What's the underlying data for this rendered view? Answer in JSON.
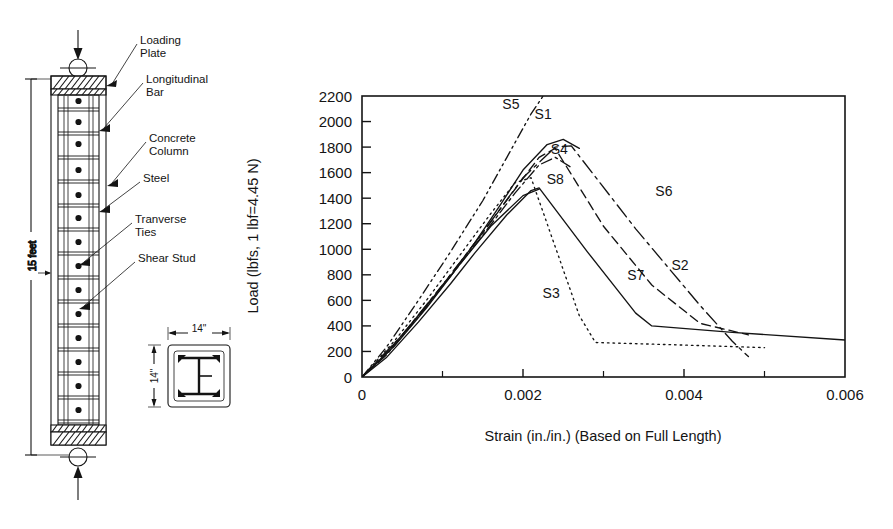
{
  "column_diagram": {
    "name": "composite-column-elevation",
    "height_label": "15 feet",
    "section_width_label": "14\"",
    "section_height_label": "14\"",
    "callouts": [
      {
        "id": "loading-plate",
        "line1": "Loading",
        "line2": "Plate"
      },
      {
        "id": "longitudinal-bar",
        "line1": "Longitudinal",
        "line2": "Bar"
      },
      {
        "id": "concrete-column",
        "line1": "Concrete",
        "line2": "Column"
      },
      {
        "id": "steel",
        "line1": "Steel",
        "line2": ""
      },
      {
        "id": "tranverse-ties",
        "line1": "Tranverse",
        "line2": "Ties"
      },
      {
        "id": "shear-stud",
        "line1": "Shear  Stud",
        "line2": ""
      }
    ]
  },
  "chart_data": {
    "type": "line",
    "title": "",
    "xlabel": "Strain (in./in.) (Based on Full Length)",
    "ylabel": "Load (lbfs, 1 lbf=4.45 N)",
    "xlim": [
      0,
      0.006
    ],
    "ylim": [
      0,
      2200
    ],
    "grid": false,
    "legend": "inline-annotations",
    "xticks": [
      0,
      0.002,
      0.004,
      0.006
    ],
    "xtick_labels": [
      "0",
      "0.002",
      "0.004",
      "0.006"
    ],
    "xminorticks": [
      0.001,
      0.003,
      0.005
    ],
    "yticks": [
      0,
      200,
      400,
      600,
      800,
      1000,
      1200,
      1400,
      1600,
      1800,
      2000,
      2200
    ],
    "ytick_labels": [
      "0",
      "200",
      "400",
      "600",
      "800",
      "1000",
      "1200",
      "1400",
      "1600",
      "1800",
      "2000",
      "2200"
    ],
    "series": [
      {
        "name": "S1",
        "style": "solid",
        "label_x": 0.00225,
        "label_y": 2020,
        "points": [
          [
            0.0,
            0
          ],
          [
            0.0002,
            120
          ],
          [
            0.0005,
            330
          ],
          [
            0.0008,
            560
          ],
          [
            0.0011,
            790
          ],
          [
            0.0014,
            1050
          ],
          [
            0.0017,
            1330
          ],
          [
            0.002,
            1620
          ],
          [
            0.0023,
            1820
          ],
          [
            0.0025,
            1860
          ],
          [
            0.0027,
            1790
          ]
        ]
      },
      {
        "name": "S2",
        "style": "dashed",
        "label_x": 0.00395,
        "label_y": 840,
        "points": [
          [
            0.0,
            0
          ],
          [
            0.0003,
            180
          ],
          [
            0.0007,
            480
          ],
          [
            0.0011,
            800
          ],
          [
            0.0015,
            1130
          ],
          [
            0.0019,
            1470
          ],
          [
            0.0022,
            1720
          ],
          [
            0.0024,
            1790
          ],
          [
            0.003,
            1180
          ],
          [
            0.0036,
            720
          ],
          [
            0.0042,
            420
          ],
          [
            0.0048,
            330
          ]
        ]
      },
      {
        "name": "S3",
        "style": "dotted",
        "label_x": 0.00235,
        "label_y": 620,
        "points": [
          [
            0.0,
            0
          ],
          [
            0.0004,
            280
          ],
          [
            0.0008,
            600
          ],
          [
            0.0012,
            940
          ],
          [
            0.0016,
            1280
          ],
          [
            0.0019,
            1520
          ],
          [
            0.0021,
            1560
          ],
          [
            0.0024,
            1020
          ],
          [
            0.0027,
            480
          ],
          [
            0.0029,
            270
          ],
          [
            0.004,
            250
          ],
          [
            0.005,
            230
          ]
        ]
      },
      {
        "name": "S4",
        "style": "dash-dot",
        "label_x": 0.00245,
        "label_y": 1745,
        "points": [
          [
            0.0,
            0
          ],
          [
            0.0003,
            170
          ],
          [
            0.0007,
            470
          ],
          [
            0.0011,
            790
          ],
          [
            0.0015,
            1110
          ],
          [
            0.0019,
            1440
          ],
          [
            0.0022,
            1660
          ],
          [
            0.0024,
            1720
          ],
          [
            0.0026,
            1640
          ]
        ]
      },
      {
        "name": "S5",
        "style": "dash-dot-dot",
        "label_x": 0.00185,
        "label_y": 2095,
        "points": [
          [
            0.0,
            0
          ],
          [
            0.0003,
            230
          ],
          [
            0.0007,
            600
          ],
          [
            0.0011,
            980
          ],
          [
            0.0015,
            1380
          ],
          [
            0.0018,
            1720
          ],
          [
            0.0021,
            2060
          ],
          [
            0.00225,
            2200
          ]
        ]
      },
      {
        "name": "S6",
        "style": "long-dash-dot",
        "label_x": 0.00375,
        "label_y": 1420,
        "points": [
          [
            0.0,
            0
          ],
          [
            0.0005,
            330
          ],
          [
            0.001,
            720
          ],
          [
            0.0015,
            1130
          ],
          [
            0.002,
            1560
          ],
          [
            0.0024,
            1800
          ],
          [
            0.0026,
            1810
          ],
          [
            0.0034,
            1160
          ],
          [
            0.0042,
            560
          ],
          [
            0.0046,
            280
          ],
          [
            0.0048,
            160
          ]
        ]
      },
      {
        "name": "S7",
        "style": "solid",
        "label_x": 0.0034,
        "label_y": 760,
        "points": [
          [
            0.0,
            0
          ],
          [
            0.0003,
            150
          ],
          [
            0.0007,
            430
          ],
          [
            0.0011,
            730
          ],
          [
            0.0014,
            970
          ],
          [
            0.0018,
            1270
          ],
          [
            0.0021,
            1460
          ],
          [
            0.0022,
            1480
          ],
          [
            0.0028,
            980
          ],
          [
            0.0034,
            500
          ],
          [
            0.0036,
            400
          ],
          [
            0.0046,
            350
          ],
          [
            0.006,
            290
          ]
        ]
      },
      {
        "name": "S8",
        "style": "solid",
        "label_x": 0.0024,
        "label_y": 1510,
        "points": [
          [
            0.0,
            0
          ],
          [
            0.0004,
            240
          ],
          [
            0.0008,
            540
          ],
          [
            0.0012,
            870
          ],
          [
            0.0016,
            1180
          ],
          [
            0.002,
            1420
          ],
          [
            0.0022,
            1470
          ]
        ]
      }
    ]
  }
}
